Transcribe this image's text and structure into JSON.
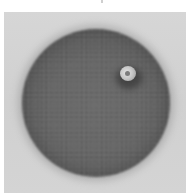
{
  "image": {
    "subject": "grayscale micrograph of a textured spherical body with a small bright inclusion",
    "colors": {
      "page_background": "#ffffff",
      "panel_background": "#d4d4d4",
      "sphere_body": "#666666",
      "sphere_edge": "#4a4a4a",
      "inclusion_highlight": "#e2e2e2"
    },
    "elements": [
      {
        "name": "sphere",
        "center": [
          96,
          103
        ],
        "radius": 74
      },
      {
        "name": "bright-inclusion",
        "center": [
          124,
          61
        ],
        "radius": 8
      }
    ]
  }
}
